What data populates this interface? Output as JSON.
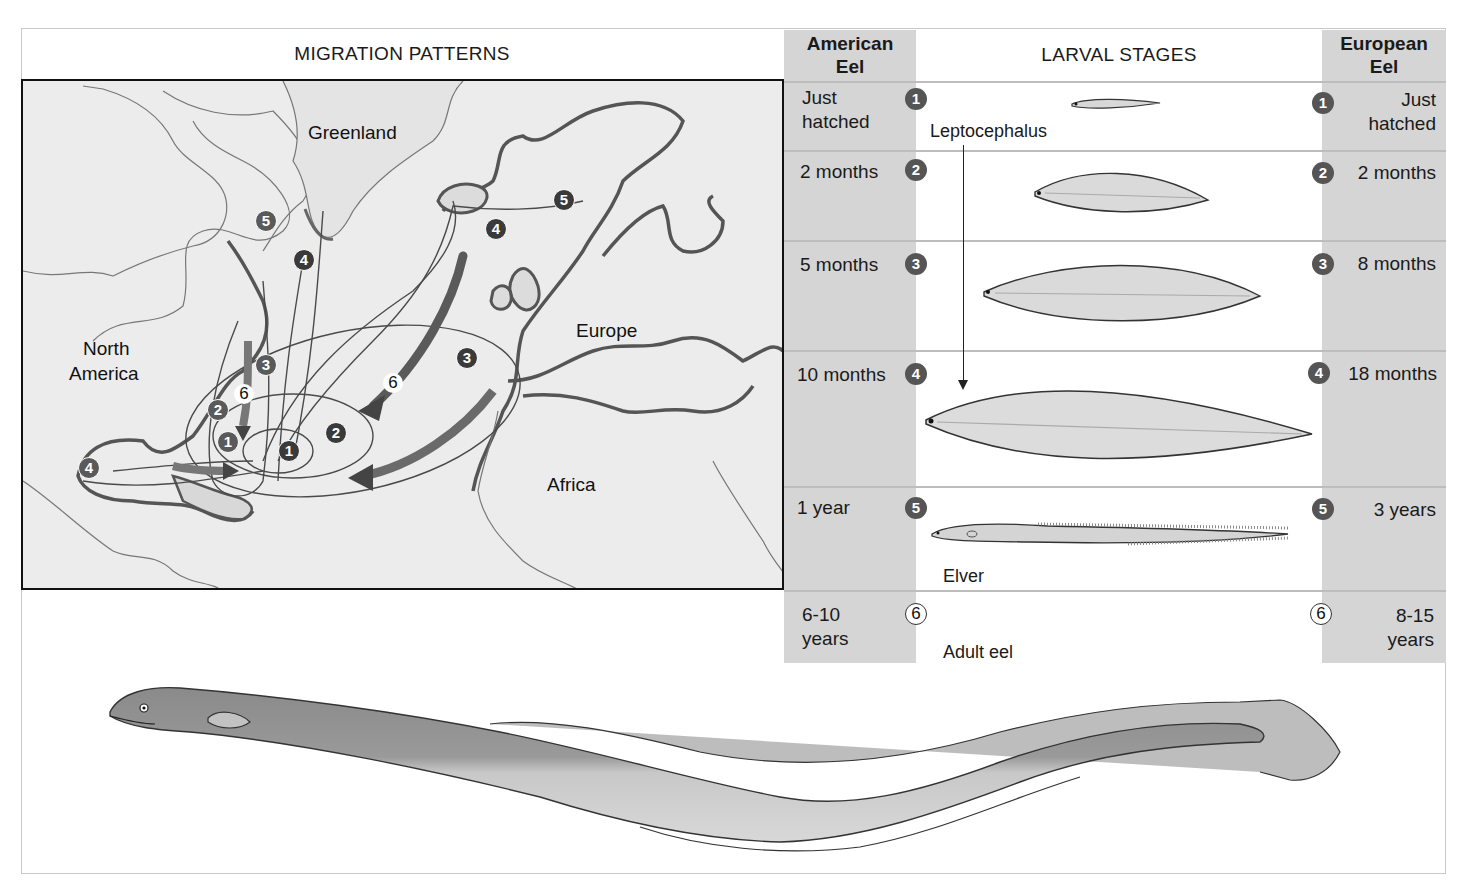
{
  "migration": {
    "title": "MIGRATION PATTERNS",
    "labels": {
      "greenland": "Greenland",
      "north_america_1": "North",
      "north_america_2": "America",
      "europe": "Europe",
      "africa": "Africa"
    },
    "american_markers": [
      "1",
      "2",
      "3",
      "4",
      "5",
      "6"
    ],
    "european_markers": [
      "1",
      "2",
      "3",
      "4",
      "5",
      "6"
    ]
  },
  "larval": {
    "title": "LARVAL STAGES",
    "american_header_1": "American",
    "american_header_2": "Eel",
    "european_header_1": "European",
    "european_header_2": "Eel",
    "captions": {
      "leptocephalus": "Leptocephalus",
      "elver": "Elver",
      "adult": "Adult eel"
    },
    "rows": [
      {
        "stage": "1",
        "american_1": "Just",
        "american_2": "hatched",
        "european_1": "Just",
        "european_2": "hatched"
      },
      {
        "stage": "2",
        "american_1": "2 months",
        "european_1": "2 months"
      },
      {
        "stage": "3",
        "american_1": "5 months",
        "european_1": "8 months"
      },
      {
        "stage": "4",
        "american_1": "10 months",
        "european_1": "18 months"
      },
      {
        "stage": "5",
        "american_1": "1 year",
        "european_1": "3 years"
      },
      {
        "stage": "6",
        "american_1": "6-10",
        "american_2": "years",
        "european_1": "8-15",
        "european_2": "years"
      }
    ]
  },
  "colors": {
    "shaded_column": "#d5d5d5",
    "map_background": "#ececec",
    "badge": "#555555",
    "frame": "#c9c9c9"
  }
}
